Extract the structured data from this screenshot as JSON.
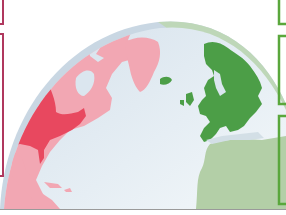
{
  "map": {
    "subject": "North Atlantic globe view",
    "regions": [
      {
        "name": "United States",
        "color": "#e8485f"
      },
      {
        "name": "North America (other)",
        "color": "#f3a9b4"
      },
      {
        "name": "Greenland",
        "color": "#f3a9b4"
      },
      {
        "name": "Iceland",
        "color": "#4c9e47"
      },
      {
        "name": "Europe",
        "color": "#4c9e47"
      },
      {
        "name": "Africa",
        "color": "#b3cfa7"
      },
      {
        "name": "Ocean",
        "color": "#d9e5ee"
      }
    ]
  },
  "colors": {
    "left_frame": "#b0385e",
    "right_frame": "#5aa73c",
    "globe_rim_left": "#c9d7e3",
    "globe_rim_right": "#bcd7b2",
    "ocean": "#dbe6ef",
    "usa": "#e8485f",
    "north_america": "#f2a7b3",
    "europe": "#4c9e47",
    "africa": "#b3cfa7"
  },
  "frames": {
    "left": [
      {
        "top": 0,
        "height": 24
      },
      {
        "top": 34,
        "height": 142
      }
    ],
    "right": [
      {
        "top": 0,
        "height": 24
      },
      {
        "top": 36,
        "height": 68
      },
      {
        "top": 116,
        "height": 88
      }
    ]
  }
}
